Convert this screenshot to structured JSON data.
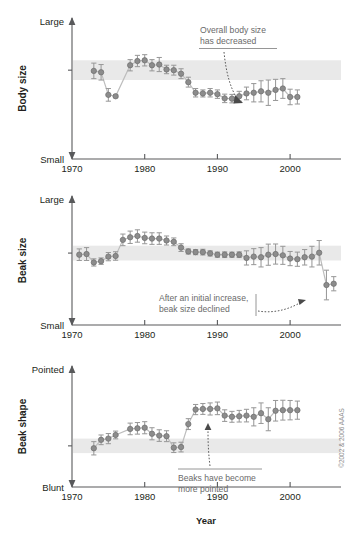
{
  "figure": {
    "x_axis_title": "Year",
    "x_ticks": [
      "1970",
      "1980",
      "1990",
      "2000"
    ],
    "x_tick_values": [
      1970,
      1980,
      1990,
      2000
    ],
    "x_range": [
      1970,
      2007
    ],
    "credit": "©2002 & 2006 AAAS"
  },
  "panels": [
    {
      "id": "body-size",
      "y_axis_label": "Body size",
      "y_top_label": "Large",
      "y_bottom_label": "Small",
      "annotation": "Overall body size\nhas decreased",
      "annotation_line1": "Overall body size",
      "annotation_line2": "has decreased"
    },
    {
      "id": "beak-size",
      "y_axis_label": "Beak size",
      "y_top_label": "Large",
      "y_bottom_label": "Small",
      "annotation": "After an initial increase,\nbeak size declined",
      "annotation_line1": "After an initial increase,",
      "annotation_line2": "beak size declined"
    },
    {
      "id": "beak-shape",
      "y_axis_label": "Beak shape",
      "y_top_label": "Pointed",
      "y_bottom_label": "Blunt",
      "annotation": "Beaks have become\nmore pointed",
      "annotation_line1": "Beaks have become",
      "annotation_line2": "more pointed"
    }
  ],
  "chart_data": [
    {
      "type": "scatter",
      "title": "Body size",
      "xlabel": "Year",
      "ylabel": "Body size",
      "ylim": [
        0,
        1
      ],
      "ytick_labels": [
        "Small",
        "Large"
      ],
      "grid": false,
      "reference_band": [
        0.56,
        0.7
      ],
      "connected": true,
      "x": [
        1973,
        1974,
        1975,
        1976,
        1978,
        1979,
        1980,
        1981,
        1982,
        1983,
        1984,
        1985,
        1986,
        1987,
        1988,
        1989,
        1990,
        1991,
        1992,
        1993,
        1994,
        1995,
        1996,
        1997,
        1998,
        1999,
        2000,
        2001
      ],
      "values": [
        0.625,
        0.615,
        0.455,
        0.445,
        0.665,
        0.695,
        0.7,
        0.665,
        0.67,
        0.635,
        0.63,
        0.605,
        0.545,
        0.47,
        0.465,
        0.47,
        0.46,
        0.43,
        0.428,
        0.445,
        0.465,
        0.47,
        0.48,
        0.47,
        0.49,
        0.5,
        0.44,
        0.44
      ],
      "error": [
        0.055,
        0.055,
        0.045,
        0.01,
        0.04,
        0.04,
        0.04,
        0.04,
        0.05,
        0.03,
        0.035,
        0.035,
        0.035,
        0.03,
        0.025,
        0.03,
        0.03,
        0.03,
        0.03,
        0.035,
        0.045,
        0.065,
        0.075,
        0.09,
        0.075,
        0.07,
        0.055,
        0.05
      ]
    },
    {
      "type": "scatter",
      "title": "Beak size",
      "xlabel": "Year",
      "ylabel": "Beak size",
      "ylim": [
        0,
        1
      ],
      "ytick_labels": [
        "Small",
        "Large"
      ],
      "grid": false,
      "reference_band": [
        0.5,
        0.615
      ],
      "connected": true,
      "x": [
        1971,
        1972,
        1973,
        1974,
        1975,
        1976,
        1977,
        1978,
        1979,
        1980,
        1981,
        1982,
        1983,
        1984,
        1985,
        1986,
        1987,
        1988,
        1989,
        1990,
        1991,
        1992,
        1993,
        1994,
        1995,
        1996,
        1997,
        1998,
        1999,
        2000,
        2001,
        2002,
        2003,
        2004,
        2005,
        2006
      ],
      "values": [
        0.545,
        0.55,
        0.485,
        0.495,
        0.53,
        0.535,
        0.66,
        0.68,
        0.69,
        0.675,
        0.67,
        0.67,
        0.655,
        0.645,
        0.6,
        0.57,
        0.565,
        0.565,
        0.555,
        0.545,
        0.545,
        0.545,
        0.545,
        0.52,
        0.53,
        0.525,
        0.545,
        0.55,
        0.54,
        0.515,
        0.51,
        0.525,
        0.53,
        0.56,
        0.31,
        0.32
      ],
      "error": [
        0.045,
        0.05,
        0.028,
        0.025,
        0.032,
        0.033,
        0.045,
        0.048,
        0.048,
        0.045,
        0.045,
        0.045,
        0.035,
        0.03,
        0.03,
        0.02,
        0.02,
        0.022,
        0.02,
        0.02,
        0.022,
        0.02,
        0.022,
        0.055,
        0.062,
        0.075,
        0.082,
        0.078,
        0.07,
        0.055,
        0.055,
        0.06,
        0.08,
        0.095,
        0.115,
        0.055
      ]
    },
    {
      "type": "scatter",
      "title": "Beak shape",
      "xlabel": "Year",
      "ylabel": "Beak shape",
      "ylim": [
        0,
        1
      ],
      "ytick_labels": [
        "Blunt",
        "Pointed"
      ],
      "grid": false,
      "reference_band": [
        0.28,
        0.4
      ],
      "connected": true,
      "x": [
        1973,
        1974,
        1975,
        1976,
        1978,
        1979,
        1980,
        1981,
        1982,
        1983,
        1984,
        1985,
        1986,
        1987,
        1988,
        1989,
        1990,
        1991,
        1992,
        1993,
        1994,
        1995,
        1996,
        1997,
        1998,
        1999,
        2000,
        2001
      ],
      "values": [
        0.32,
        0.39,
        0.4,
        0.43,
        0.48,
        0.485,
        0.49,
        0.44,
        0.425,
        0.42,
        0.325,
        0.33,
        0.52,
        0.64,
        0.645,
        0.645,
        0.65,
        0.59,
        0.58,
        0.585,
        0.59,
        0.58,
        0.61,
        0.56,
        0.63,
        0.635,
        0.635,
        0.635
      ],
      "error": [
        0.055,
        0.04,
        0.042,
        0.032,
        0.048,
        0.048,
        0.05,
        0.05,
        0.048,
        0.045,
        0.04,
        0.04,
        0.045,
        0.042,
        0.045,
        0.05,
        0.052,
        0.048,
        0.045,
        0.048,
        0.052,
        0.075,
        0.085,
        0.095,
        0.085,
        0.082,
        0.08,
        0.075
      ]
    }
  ]
}
